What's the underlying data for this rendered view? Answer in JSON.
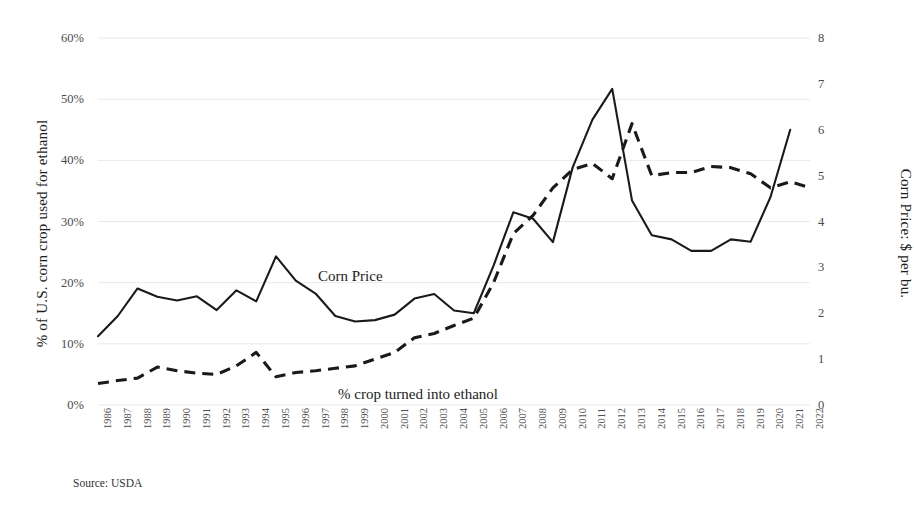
{
  "chart_data": {
    "type": "line",
    "title": "",
    "subtitle": "",
    "xlabel": "",
    "ylabel": "% of U.S. corn crop used for ethanol",
    "y2label": "Corn Price: $ per bu.",
    "grid": true,
    "legend_position": "inline-annotations",
    "ylim": [
      0,
      60
    ],
    "y2lim": [
      0,
      8
    ],
    "yticks": [
      "0%",
      "10%",
      "20%",
      "30%",
      "40%",
      "50%",
      "60%"
    ],
    "ytick_values": [
      0,
      10,
      20,
      30,
      40,
      50,
      60
    ],
    "y2ticks": [
      "0",
      "1",
      "2",
      "3",
      "4",
      "5",
      "6",
      "7",
      "8"
    ],
    "y2tick_values": [
      0,
      1,
      2,
      3,
      4,
      5,
      6,
      7,
      8
    ],
    "categories": [
      "1986",
      "1987",
      "1988",
      "1989",
      "1990",
      "1991",
      "1992",
      "1993",
      "1994",
      "1995",
      "1996",
      "1997",
      "1998",
      "1999",
      "2000",
      "2001",
      "2002",
      "2003",
      "2004",
      "2005",
      "2006",
      "2007",
      "2008",
      "2009",
      "2010",
      "2011",
      "2012",
      "2013",
      "2014",
      "2015",
      "2016",
      "2017",
      "2018",
      "2019",
      "2020",
      "2021",
      "2022"
    ],
    "series": [
      {
        "name": "Corn Price",
        "axis": "right",
        "style": "solid",
        "color": "#1a1a1a",
        "unit": "$ per bu.",
        "values": [
          1.5,
          1.94,
          2.54,
          2.36,
          2.28,
          2.37,
          2.07,
          2.5,
          2.26,
          3.24,
          2.71,
          2.43,
          1.94,
          1.82,
          1.85,
          1.97,
          2.32,
          2.42,
          2.06,
          2.0,
          3.04,
          4.2,
          4.06,
          3.55,
          5.18,
          6.22,
          6.89,
          4.46,
          3.7,
          3.61,
          3.36,
          3.36,
          3.61,
          3.56,
          4.53,
          6.0,
          0
        ]
      },
      {
        "name": "% crop turned into ethanol",
        "axis": "left",
        "style": "dashed",
        "color": "#1a1a1a",
        "unit": "%",
        "values": [
          3.5,
          4.0,
          4.4,
          6.2,
          5.6,
          5.2,
          5.0,
          6.4,
          8.6,
          4.6,
          5.3,
          5.6,
          6.0,
          6.4,
          7.5,
          8.6,
          11.0,
          11.7,
          13.0,
          14.2,
          20.0,
          28.0,
          31.0,
          35.5,
          38.5,
          39.5,
          37.0,
          46.0,
          37.5,
          38.0,
          38.0,
          39.0,
          38.8,
          37.8,
          35.5,
          36.5,
          35.5
        ]
      }
    ],
    "annotations": [
      {
        "id": "corn-price",
        "text": "Corn Price"
      },
      {
        "id": "ethanol-share",
        "text": "% crop turned into ethanol"
      }
    ],
    "source": "Source: USDA"
  },
  "colors": {
    "line": "#1a1a1a",
    "grid": "#e9e9e9",
    "text": "#1b1b1b",
    "tick": "#4a4a4a",
    "background": "#ffffff"
  }
}
